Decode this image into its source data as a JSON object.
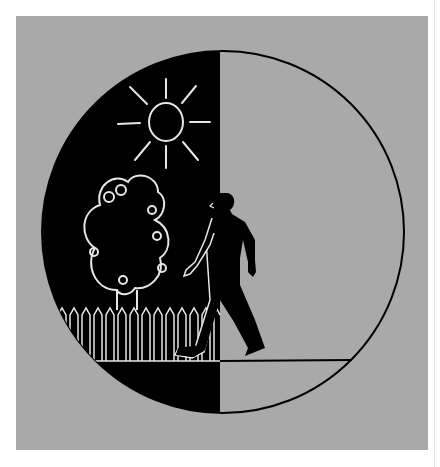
{
  "illustration": {
    "subject": "Person walking from a dark half (sun, tree, picket fence) into a light empty half of a circle",
    "colors": {
      "background": "#ffffff",
      "panel": "#a9a9a9",
      "dark_half": "#000000",
      "light_half": "#a9a9a9",
      "line_on_dark": "#e6e6e6",
      "outline": "#000000"
    },
    "elements": [
      "circle",
      "sun",
      "tree",
      "picket-fence",
      "walking-person",
      "ground-line"
    ]
  }
}
